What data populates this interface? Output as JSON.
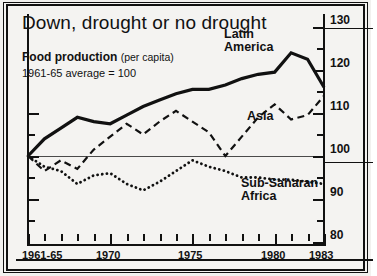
{
  "chart_data": {
    "type": "line",
    "title": "Down, drought or no drought",
    "subtitle_bold": "Food production",
    "subtitle_paren": "(per capita)",
    "subtitle_note": "1961-65 average = 100",
    "xlabel": "",
    "ylabel": "",
    "ylim": [
      76,
      132
    ],
    "yticks": [
      80,
      90,
      100,
      110,
      120,
      130
    ],
    "ytick_labels": [
      "80",
      "90",
      "100",
      "110",
      "120",
      "130"
    ],
    "grid": false,
    "baseline": 100,
    "legend_position": "inline-annotations",
    "xtick_labels": [
      "1961-65",
      "1970",
      "1975",
      "1980",
      "1983"
    ],
    "xtick_values": [
      1965,
      1970,
      1975,
      1980,
      1983
    ],
    "x": [
      1965,
      1966,
      1967,
      1968,
      1969,
      1970,
      1971,
      1972,
      1973,
      1974,
      1975,
      1976,
      1977,
      1978,
      1979,
      1980,
      1981,
      1982,
      1983
    ],
    "series": [
      {
        "name": "Latin America",
        "style": "solid",
        "values": [
          100,
          104,
          106.5,
          109,
          108,
          107.5,
          109.5,
          111.5,
          113,
          114.5,
          115.5,
          115.5,
          116.5,
          118,
          119,
          119.5,
          124,
          122.5,
          116
        ]
      },
      {
        "name": "Asia",
        "style": "dashed",
        "values": [
          100,
          96.5,
          99,
          97,
          101.5,
          104.5,
          107.5,
          105,
          108,
          110.5,
          108,
          105.5,
          100,
          104.5,
          109,
          112,
          108.5,
          109.5,
          114
        ]
      },
      {
        "name": "Sub-Saharan Africa",
        "style": "dotted",
        "values": [
          100,
          97.5,
          96.5,
          93.5,
          95.5,
          96,
          93.5,
          92,
          94,
          96.5,
          99,
          97.5,
          96.5,
          95,
          95,
          94.5,
          94.5,
          94,
          93.5
        ]
      }
    ],
    "annotations": [
      {
        "name": "latin-america-label",
        "text": "Latin\nAmerica"
      },
      {
        "name": "asia-label",
        "text": "Asia"
      },
      {
        "name": "sub-saharan-africa-label",
        "text": "Sub-Saharan\nAfrica"
      }
    ],
    "colors": {
      "ink": "#111111",
      "background": "#f4f3f1",
      "baseline": "#4a4a4a"
    }
  },
  "labels": {
    "title": "Down, drought or no drought",
    "food_production": "Food production",
    "per_capita": "(per capita)",
    "average_note": "1961-65 average = 100",
    "latin_america_l1": "Latin",
    "latin_america_l2": "America",
    "asia": "Asia",
    "africa_l1": "Sub-Saharan",
    "africa_l2": "Africa",
    "y_130": "130",
    "y_120": "120",
    "y_110": "110",
    "y_100": "100",
    "y_90": "90",
    "y_80": "80",
    "x_1961_65": "1961-65",
    "x_1970": "1970",
    "x_1975": "1975",
    "x_1980": "1980",
    "x_1983": "1983"
  }
}
